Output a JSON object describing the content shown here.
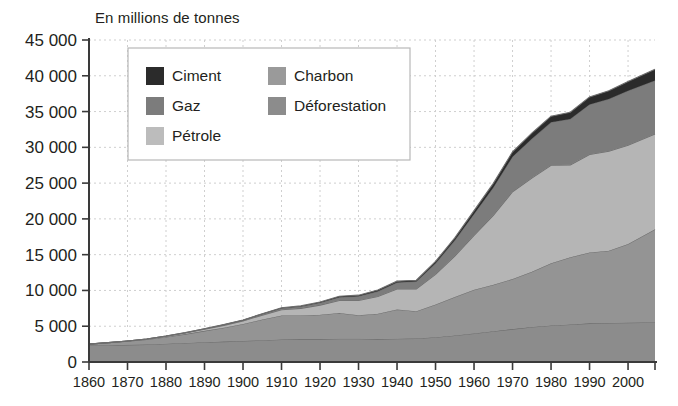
{
  "chart_data": {
    "type": "area",
    "stacked": true,
    "title": "En millions de tonnes",
    "xlabel": "",
    "ylabel": "",
    "xlim": [
      1860,
      2007
    ],
    "ylim": [
      0,
      45000
    ],
    "grid": true,
    "legend_position": "top-left-inside",
    "x_ticks": [
      1860,
      1870,
      1880,
      1890,
      1900,
      1910,
      1920,
      1930,
      1940,
      1950,
      1960,
      1970,
      1980,
      1990,
      2000
    ],
    "y_ticks": [
      0,
      5000,
      10000,
      15000,
      20000,
      25000,
      30000,
      35000,
      40000,
      45000
    ],
    "y_tick_labels": [
      "0",
      "5 000",
      "10 000",
      "15 000",
      "20 000",
      "25 000",
      "30 000",
      "35 000",
      "40 000",
      "45 000"
    ],
    "x_tick_labels": [
      "1860",
      "1870",
      "1880",
      "1890",
      "1900",
      "1910",
      "1920",
      "1930",
      "1940",
      "1950",
      "1960",
      "1970",
      "1980",
      "1990",
      "2000"
    ],
    "x": [
      1860,
      1865,
      1870,
      1875,
      1880,
      1885,
      1890,
      1895,
      1900,
      1905,
      1910,
      1915,
      1920,
      1925,
      1930,
      1935,
      1940,
      1945,
      1950,
      1955,
      1960,
      1965,
      1970,
      1975,
      1980,
      1985,
      1990,
      1995,
      2000,
      2007
    ],
    "stack_order_bottom_to_top": [
      "Déforestation",
      "Charbon",
      "Pétrole",
      "Gaz",
      "Ciment"
    ],
    "series": [
      {
        "name": "Déforestation",
        "color": "#8c8c8c",
        "values": [
          2300,
          2350,
          2400,
          2450,
          2550,
          2650,
          2750,
          2850,
          2950,
          3050,
          3150,
          3200,
          3200,
          3250,
          3250,
          3200,
          3250,
          3300,
          3450,
          3700,
          4000,
          4300,
          4600,
          4900,
          5100,
          5250,
          5400,
          5450,
          5500,
          5550
        ]
      },
      {
        "name": "Charbon",
        "color": "#949494",
        "values": [
          200,
          350,
          500,
          700,
          950,
          1250,
          1600,
          1950,
          2350,
          2900,
          3350,
          3300,
          3400,
          3600,
          3300,
          3550,
          4100,
          3800,
          4600,
          5400,
          6100,
          6500,
          7000,
          7700,
          8700,
          9400,
          9900,
          10100,
          11000,
          13000
        ]
      },
      {
        "name": "Pétrole",
        "color": "#b5b5b5",
        "values": [
          0,
          10,
          30,
          60,
          100,
          160,
          230,
          320,
          430,
          600,
          800,
          1000,
          1350,
          1750,
          2050,
          2400,
          2850,
          3100,
          4200,
          5700,
          7600,
          9700,
          12200,
          13100,
          13700,
          12900,
          13700,
          13900,
          13800,
          13300
        ]
      },
      {
        "name": "Gaz",
        "color": "#7c7c7c",
        "values": [
          0,
          0,
          5,
          10,
          20,
          35,
          55,
          80,
          110,
          150,
          200,
          260,
          340,
          450,
          580,
          720,
          900,
          1050,
          1550,
          2200,
          3000,
          3900,
          4900,
          5500,
          6000,
          6400,
          7000,
          7300,
          7600,
          7500
        ]
      },
      {
        "name": "Ciment",
        "color": "#2b2b2b",
        "values": [
          0,
          0,
          0,
          0,
          5,
          10,
          15,
          25,
          35,
          50,
          70,
          80,
          100,
          140,
          160,
          180,
          200,
          180,
          250,
          350,
          450,
          560,
          680,
          780,
          860,
          950,
          1050,
          1150,
          1300,
          1550
        ]
      }
    ],
    "totals_note": "Valeurs empilées: total ~2500 en 1860, ~39000 en 2007"
  },
  "legend": {
    "entries": [
      {
        "label": "Ciment",
        "color": "#2b2b2b"
      },
      {
        "label": "Charbon",
        "color": "#9a9a9a"
      },
      {
        "label": "Gaz",
        "color": "#7c7c7c"
      },
      {
        "label": "Déforestation",
        "color": "#8c8c8c"
      },
      {
        "label": "Pétrole",
        "color": "#bcbcbc"
      }
    ]
  },
  "colors": {
    "axis": "#3a3a3a",
    "grid": "#cfcfcf",
    "text": "#231f20",
    "background": "#ffffff",
    "legend_border": "#b8b8b8"
  }
}
